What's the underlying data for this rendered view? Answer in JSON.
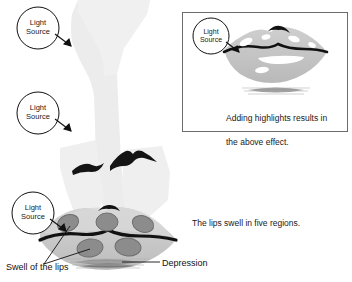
{
  "figure": {
    "background_color": "#ffffff",
    "width": 352,
    "height": 282
  },
  "palette": {
    "paper": "#ffffff",
    "face_fill": "#ececec",
    "face_fill_light": "#f2f2f2",
    "lip_fill": "#c9c9c9",
    "lip_fill_dark": "#b7b7b7",
    "swell_fill": "#8c8c8c",
    "swell_stroke": "#6e6e6e",
    "line_black": "#111111",
    "box_border": "#6b6b6b",
    "shadow_gray": "#9a9a9a",
    "highlight_white": "#ffffff"
  },
  "callouts": [
    {
      "id": "light-source-top",
      "label": "Light\nSource",
      "line1": "Light",
      "line2": "Source",
      "cx": 38,
      "cy": 28,
      "r": 21,
      "arrow_to_x": 72,
      "arrow_to_y": 46
    },
    {
      "id": "light-source-middle",
      "label": "Light\nSource",
      "line1": "Light",
      "line2": "Source",
      "cx": 38,
      "cy": 113,
      "r": 21,
      "arrow_to_x": 72,
      "arrow_to_y": 131
    },
    {
      "id": "light-source-bottom",
      "label": "Light\nSource",
      "line1": "Light",
      "line2": "Source",
      "cx": 33,
      "cy": 213,
      "r": 21,
      "arrow_to_x": 66,
      "arrow_to_y": 231
    },
    {
      "id": "light-source-inset",
      "label": "Light\nSource",
      "line1": "Light",
      "line2": "Source",
      "cx": 211,
      "cy": 36,
      "r": 18,
      "arrow_to_x": 239,
      "arrow_to_y": 52
    }
  ],
  "inset": {
    "name": "highlight-result-inset",
    "x": 182,
    "y": 12,
    "width": 166,
    "height": 120,
    "caption": "Adding highlights results in\nthe above effect.",
    "caption_line1": "Adding highlights results in",
    "caption_line2": "the above effect."
  },
  "notes": [
    {
      "id": "five-regions-note",
      "text": "The lips swell in five regions.",
      "x": 192,
      "y": 222
    }
  ],
  "annotations": [
    {
      "id": "swell-label",
      "text": "Swell of the lips",
      "x": 6,
      "y": 268
    },
    {
      "id": "depression-label",
      "text": "Depression",
      "x": 162,
      "y": 265
    }
  ],
  "swell_regions": {
    "count": 5,
    "description": "Five shaded oval swell regions on the lips",
    "upper": [
      {
        "id": "swell-upper-left",
        "cx": 68,
        "cy": 223,
        "rx": 11,
        "ry": 8,
        "rotate": -22
      },
      {
        "id": "swell-upper-center",
        "cx": 107,
        "cy": 222,
        "rx": 11,
        "ry": 9,
        "rotate": 0
      },
      {
        "id": "swell-upper-right",
        "cx": 143,
        "cy": 224,
        "rx": 11,
        "ry": 8,
        "rotate": 20
      }
    ],
    "lower": [
      {
        "id": "swell-lower-left",
        "cx": 90,
        "cy": 248,
        "rx": 13,
        "ry": 9,
        "rotate": -8
      },
      {
        "id": "swell-lower-right",
        "cx": 128,
        "cy": 247,
        "rx": 13,
        "ry": 9,
        "rotate": 6
      }
    ]
  },
  "highlights": {
    "description": "White specular highlights added to lips in inset",
    "count": 6
  },
  "leader_lines": {
    "swell_lines": [
      {
        "from_x": 44,
        "from_y": 264,
        "to_x": 70,
        "to_y": 225
      },
      {
        "from_x": 44,
        "from_y": 264,
        "to_x": 92,
        "to_y": 248
      }
    ],
    "depression_line": {
      "from_x": 160,
      "from_y": 262,
      "to_x": 123,
      "to_y": 262
    }
  }
}
